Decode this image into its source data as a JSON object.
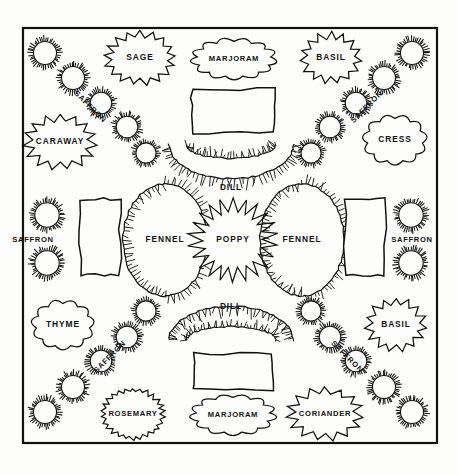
{
  "plan": {
    "title": "Herb Garden Plan",
    "background_color": "#fdfdfb",
    "ink_color": "#111111",
    "frame": {
      "x": 23,
      "y": 28,
      "width": 414,
      "height": 415
    }
  },
  "beds": [
    {
      "id": "sage",
      "label": "SAGE",
      "shape": "spiky-cloud",
      "cx": 140,
      "cy": 58,
      "rx": 36,
      "ry": 27
    },
    {
      "id": "marjoram-top",
      "label": "MARJORAM",
      "shape": "cloud",
      "cx": 234,
      "cy": 59,
      "rx": 44,
      "ry": 22
    },
    {
      "id": "basil-top",
      "label": "BASIL",
      "shape": "star",
      "cx": 331,
      "cy": 58,
      "rx": 31,
      "ry": 26
    },
    {
      "id": "caraway",
      "label": "CARAWAY",
      "shape": "star",
      "cx": 60,
      "cy": 142,
      "rx": 37,
      "ry": 28
    },
    {
      "id": "cress",
      "label": "CRESS",
      "shape": "cloud",
      "cx": 395,
      "cy": 140,
      "rx": 33,
      "ry": 27
    },
    {
      "id": "rect-top",
      "label": "",
      "shape": "rect",
      "cx": 233,
      "cy": 111,
      "rx": 41,
      "ry": 22
    },
    {
      "id": "dill-top",
      "label": "DILL",
      "shape": "arc-down",
      "cx": 231,
      "cy": 160,
      "rx": 62,
      "ry": 34
    },
    {
      "id": "fennel-left",
      "label": "FENNEL",
      "shape": "lens-v",
      "cx": 165,
      "cy": 240,
      "rx": 28,
      "ry": 56
    },
    {
      "id": "poppy",
      "label": "POPPY",
      "shape": "burst",
      "cx": 233,
      "cy": 240,
      "rx": 45,
      "ry": 42
    },
    {
      "id": "fennel-right",
      "label": "FENNEL",
      "shape": "lens-v",
      "cx": 302,
      "cy": 240,
      "rx": 28,
      "ry": 56
    },
    {
      "id": "rect-left",
      "label": "",
      "shape": "rect",
      "cx": 100,
      "cy": 237,
      "rx": 20,
      "ry": 38
    },
    {
      "id": "rect-right",
      "label": "",
      "shape": "rect",
      "cx": 365,
      "cy": 237,
      "rx": 20,
      "ry": 38
    },
    {
      "id": "dill-bottom",
      "label": "DILL",
      "shape": "arc-up",
      "cx": 231,
      "cy": 325,
      "rx": 62,
      "ry": 34
    },
    {
      "id": "thyme",
      "label": "THYME",
      "shape": "cloud",
      "cx": 63,
      "cy": 325,
      "rx": 32,
      "ry": 27
    },
    {
      "id": "basil-bottom",
      "label": "BASIL",
      "shape": "star",
      "cx": 396,
      "cy": 325,
      "rx": 31,
      "ry": 27
    },
    {
      "id": "rect-bottom",
      "label": "",
      "shape": "rect",
      "cx": 233,
      "cy": 372,
      "rx": 39,
      "ry": 18
    },
    {
      "id": "rosemary",
      "label": "ROSEMARY",
      "shape": "spiky-circle",
      "cx": 133,
      "cy": 414,
      "rx": 32,
      "ry": 26
    },
    {
      "id": "marjoram-bot",
      "label": "MARJORAM",
      "shape": "cloud",
      "cx": 233,
      "cy": 415,
      "rx": 44,
      "ry": 22
    },
    {
      "id": "coriander",
      "label": "CORIANDER",
      "shape": "star",
      "cx": 325,
      "cy": 414,
      "rx": 39,
      "ry": 27
    }
  ],
  "saffron_rings": [
    {
      "cx": 45,
      "cy": 53,
      "r": 16
    },
    {
      "cx": 73,
      "cy": 78,
      "r": 16
    },
    {
      "cx": 101,
      "cy": 103,
      "r": 15
    },
    {
      "cx": 127,
      "cy": 127,
      "r": 15
    },
    {
      "cx": 146,
      "cy": 153,
      "r": 14
    },
    {
      "cx": 412,
      "cy": 53,
      "r": 16
    },
    {
      "cx": 384,
      "cy": 78,
      "r": 16
    },
    {
      "cx": 356,
      "cy": 103,
      "r": 15
    },
    {
      "cx": 330,
      "cy": 127,
      "r": 15
    },
    {
      "cx": 311,
      "cy": 153,
      "r": 14
    },
    {
      "cx": 47,
      "cy": 215,
      "r": 17
    },
    {
      "cx": 47,
      "cy": 263,
      "r": 17
    },
    {
      "cx": 411,
      "cy": 215,
      "r": 17
    },
    {
      "cx": 411,
      "cy": 263,
      "r": 17
    },
    {
      "cx": 146,
      "cy": 311,
      "r": 14
    },
    {
      "cx": 127,
      "cy": 337,
      "r": 15
    },
    {
      "cx": 101,
      "cy": 361,
      "r": 15
    },
    {
      "cx": 73,
      "cy": 387,
      "r": 16
    },
    {
      "cx": 45,
      "cy": 412,
      "r": 16
    },
    {
      "cx": 311,
      "cy": 311,
      "r": 14
    },
    {
      "cx": 330,
      "cy": 337,
      "r": 15
    },
    {
      "cx": 356,
      "cy": 361,
      "r": 15
    },
    {
      "cx": 384,
      "cy": 387,
      "r": 16
    },
    {
      "cx": 412,
      "cy": 412,
      "r": 16
    }
  ],
  "saffron_labels": [
    {
      "label": "SAFFRON",
      "x": 90,
      "y": 107,
      "rotate": 45,
      "size": 7.6
    },
    {
      "label": "SAFFRON",
      "x": 367,
      "y": 107,
      "rotate": -45,
      "size": 7.6
    },
    {
      "label": "SAFFRON",
      "x": 33,
      "y": 240,
      "rotate": 0,
      "size": 7.6
    },
    {
      "label": "SAFFRON",
      "x": 412,
      "y": 240,
      "rotate": 0,
      "size": 7.6
    },
    {
      "label": "SAFFRON",
      "x": 110,
      "y": 357,
      "rotate": -45,
      "size": 7.6
    },
    {
      "label": "SAFFRON",
      "x": 347,
      "y": 357,
      "rotate": 45,
      "size": 7.6
    }
  ],
  "legend": {
    "herb_names": [
      "SAGE",
      "MARJORAM",
      "BASIL",
      "CARAWAY",
      "CRESS",
      "DILL",
      "FENNEL",
      "POPPY",
      "THYME",
      "ROSEMARY",
      "CORIANDER",
      "SAFFRON"
    ]
  }
}
